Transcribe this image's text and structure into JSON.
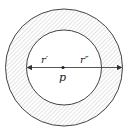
{
  "diagram": {
    "type": "annulus",
    "labels": {
      "inner_radius": "r′",
      "outer_radius": "r″",
      "center": "p"
    },
    "colors": {
      "stroke": "#444444",
      "hatch": "#b8b8b8",
      "background": "#ffffff"
    }
  }
}
